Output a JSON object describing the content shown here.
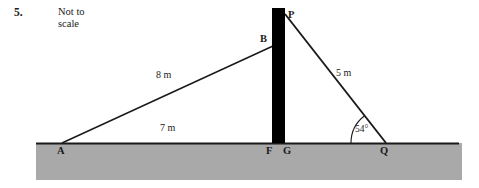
{
  "question": {
    "number": "5.",
    "note_line1": "Not to",
    "note_line2": "scale"
  },
  "colors": {
    "ground_fill": "#a9a9a9",
    "ground_line": "#1a1a1a",
    "tower_fill": "#000000",
    "stroke": "#1a1a1a",
    "text": "#1a1a1a",
    "background": "#ffffff"
  },
  "diagram": {
    "type": "geometry-figure",
    "points": {
      "A": {
        "label": "A",
        "x": 62,
        "y": 143
      },
      "B": {
        "label": "B",
        "x": 272,
        "y": 47
      },
      "P": {
        "label": "P",
        "x": 285,
        "y": 14
      },
      "F": {
        "label": "F",
        "x": 272,
        "y": 143
      },
      "G": {
        "label": "G",
        "x": 285,
        "y": 143
      },
      "Q": {
        "label": "Q",
        "x": 385,
        "y": 143
      }
    },
    "segments": [
      {
        "name": "AB",
        "from": "A",
        "to": "B",
        "length_label": "8 m"
      },
      {
        "name": "AF",
        "from": "A",
        "to": "F",
        "length_label": "7 m"
      },
      {
        "name": "PQ",
        "from": "P",
        "to": "Q",
        "length_label": "5 m"
      }
    ],
    "measurements": {
      "AB": "8 m",
      "AF": "7 m",
      "PQ": "5 m"
    },
    "angles": [
      {
        "name": "angle-at-Q",
        "vertex": "Q",
        "value": "54°"
      }
    ],
    "tower": {
      "name": "vertical-tower",
      "left": 272,
      "right": 285,
      "top": 8,
      "bottom": 143
    },
    "ground": {
      "name": "ground-strip",
      "left": 36,
      "right": 462,
      "top": 143,
      "bottom": 180
    }
  }
}
